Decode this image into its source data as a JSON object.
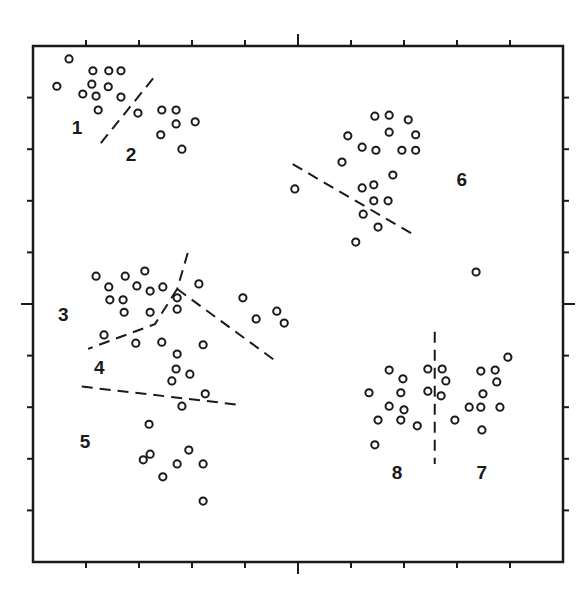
{
  "chart_data": {
    "type": "scatter",
    "title": "",
    "xlabel": "",
    "ylabel": "",
    "xlim": [
      0,
      100
    ],
    "ylim": [
      0,
      100
    ],
    "grid": false,
    "legend": "none",
    "ticks": {
      "positions": [
        10,
        20,
        30,
        40,
        50,
        60,
        70,
        80,
        90
      ],
      "major": [
        50
      ],
      "labels": []
    },
    "colors": {
      "ink": "#1a1a1a",
      "background": "#ffffff"
    },
    "marker": "open-circle",
    "points": [
      [
        6.8,
        97.5
      ],
      [
        4.5,
        92.2
      ],
      [
        11.3,
        95.2
      ],
      [
        14.3,
        95.2
      ],
      [
        16.6,
        95.2
      ],
      [
        11.1,
        92.6
      ],
      [
        14.2,
        92.1
      ],
      [
        9.4,
        90.7
      ],
      [
        11.9,
        90.3
      ],
      [
        16.6,
        90.1
      ],
      [
        12.3,
        87.6
      ],
      [
        19.8,
        87.0
      ],
      [
        24.3,
        87.6
      ],
      [
        27.0,
        87.6
      ],
      [
        27.0,
        84.9
      ],
      [
        30.6,
        85.3
      ],
      [
        24.1,
        82.8
      ],
      [
        28.1,
        80.0
      ],
      [
        64.5,
        86.4
      ],
      [
        67.2,
        86.6
      ],
      [
        70.8,
        85.7
      ],
      [
        67.2,
        83.3
      ],
      [
        72.2,
        82.8
      ],
      [
        59.4,
        82.6
      ],
      [
        62.1,
        80.4
      ],
      [
        64.7,
        79.8
      ],
      [
        69.6,
        79.8
      ],
      [
        72.2,
        79.8
      ],
      [
        58.3,
        77.5
      ],
      [
        67.9,
        75.0
      ],
      [
        49.4,
        72.3
      ],
      [
        62.1,
        72.5
      ],
      [
        64.3,
        73.1
      ],
      [
        64.3,
        70.0
      ],
      [
        67.0,
        70.0
      ],
      [
        62.3,
        67.4
      ],
      [
        65.1,
        64.9
      ],
      [
        60.9,
        62.0
      ],
      [
        83.6,
        56.2
      ],
      [
        11.9,
        55.4
      ],
      [
        17.4,
        55.4
      ],
      [
        21.1,
        56.4
      ],
      [
        14.3,
        53.3
      ],
      [
        19.6,
        53.5
      ],
      [
        22.1,
        52.5
      ],
      [
        24.5,
        53.3
      ],
      [
        14.5,
        50.8
      ],
      [
        17.0,
        50.8
      ],
      [
        17.2,
        48.4
      ],
      [
        22.1,
        48.4
      ],
      [
        27.2,
        51.2
      ],
      [
        27.2,
        49.0
      ],
      [
        13.4,
        44.0
      ],
      [
        31.3,
        53.9
      ],
      [
        39.6,
        51.2
      ],
      [
        42.1,
        47.1
      ],
      [
        46.0,
        48.6
      ],
      [
        47.4,
        46.3
      ],
      [
        19.4,
        42.4
      ],
      [
        24.3,
        42.6
      ],
      [
        27.2,
        40.3
      ],
      [
        32.1,
        42.1
      ],
      [
        27.0,
        37.4
      ],
      [
        29.6,
        36.4
      ],
      [
        26.2,
        35.1
      ],
      [
        32.5,
        32.6
      ],
      [
        28.1,
        30.2
      ],
      [
        21.9,
        26.7
      ],
      [
        22.1,
        20.9
      ],
      [
        20.8,
        19.8
      ],
      [
        29.4,
        21.7
      ],
      [
        27.2,
        19.0
      ],
      [
        32.1,
        19.0
      ],
      [
        24.5,
        16.5
      ],
      [
        32.1,
        11.8
      ],
      [
        67.2,
        37.2
      ],
      [
        69.8,
        35.5
      ],
      [
        63.4,
        32.8
      ],
      [
        69.4,
        32.8
      ],
      [
        67.2,
        30.2
      ],
      [
        70.0,
        29.5
      ],
      [
        65.1,
        27.5
      ],
      [
        69.4,
        27.5
      ],
      [
        72.5,
        26.4
      ],
      [
        64.5,
        22.7
      ],
      [
        74.5,
        37.4
      ],
      [
        74.5,
        33.1
      ],
      [
        77.2,
        37.4
      ],
      [
        77.9,
        35.1
      ],
      [
        77.0,
        32.2
      ],
      [
        89.6,
        39.7
      ],
      [
        84.5,
        37.0
      ],
      [
        87.2,
        37.2
      ],
      [
        87.5,
        34.9
      ],
      [
        84.9,
        32.6
      ],
      [
        82.3,
        30.0
      ],
      [
        84.5,
        30.0
      ],
      [
        88.1,
        30.0
      ],
      [
        79.6,
        27.5
      ],
      [
        84.7,
        25.6
      ]
    ],
    "separators": [
      {
        "name": "1|2",
        "path": [
          [
            12.8,
            81.2
          ],
          [
            23.2,
            94.4
          ]
        ]
      },
      {
        "name": "3|6-top",
        "path": [
          [
            29.2,
            59.9
          ],
          [
            27.2,
            52.9
          ]
        ]
      },
      {
        "name": "3|4",
        "path": [
          [
            27.2,
            52.9
          ],
          [
            23.0,
            46.1
          ],
          [
            10.4,
            41.3
          ]
        ]
      },
      {
        "name": "3-right",
        "path": [
          [
            27.2,
            52.9
          ],
          [
            46.0,
            38.8
          ]
        ]
      },
      {
        "name": "4|5",
        "path": [
          [
            9.2,
            34.0
          ],
          [
            39.4,
            30.4
          ]
        ]
      },
      {
        "name": "6",
        "path": [
          [
            49.0,
            77.1
          ],
          [
            72.2,
            63.2
          ]
        ]
      },
      {
        "name": "7|8",
        "path": [
          [
            75.8,
            44.6
          ],
          [
            75.8,
            19.0
          ]
        ]
      }
    ],
    "cluster_labels": [
      {
        "text": "1",
        "x": 8.3,
        "y": 83.9
      },
      {
        "text": "2",
        "x": 18.5,
        "y": 78.7
      },
      {
        "text": "3",
        "x": 5.7,
        "y": 47.7
      },
      {
        "text": "4",
        "x": 12.5,
        "y": 37.4
      },
      {
        "text": "5",
        "x": 9.8,
        "y": 23.1
      },
      {
        "text": "6",
        "x": 80.9,
        "y": 73.8
      },
      {
        "text": "7",
        "x": 84.7,
        "y": 17.1
      },
      {
        "text": "8",
        "x": 68.7,
        "y": 17.1
      }
    ]
  }
}
